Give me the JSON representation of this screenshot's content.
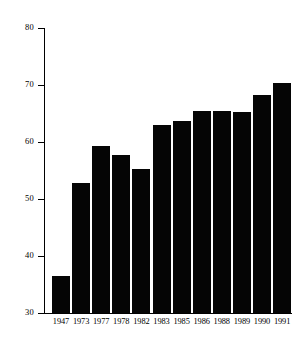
{
  "chart_data": {
    "type": "bar",
    "title": "",
    "subtitle": "",
    "xlabel": "",
    "ylabel": "",
    "categories": [
      "1947",
      "1973",
      "1977",
      "1978",
      "1982",
      "1983",
      "1985",
      "1986",
      "1988",
      "1989",
      "1990",
      "1991"
    ],
    "values": [
      36.5,
      52.8,
      59.3,
      57.7,
      55.3,
      63.0,
      63.6,
      65.5,
      65.5,
      65.3,
      68.2,
      70.3
    ],
    "series": [
      {
        "name": "value",
        "values": [
          36.5,
          52.8,
          59.3,
          57.7,
          55.3,
          63.0,
          63.6,
          65.5,
          65.5,
          65.3,
          68.2,
          70.3
        ]
      }
    ],
    "ylim": [
      30,
      80
    ],
    "yticks": [
      30,
      40,
      50,
      60,
      70,
      80
    ],
    "ytick_labels": [
      "30",
      "40",
      "50",
      "60",
      "70",
      "80"
    ],
    "xlim_categories": 12,
    "grid": false,
    "legend": null,
    "legend_position": "none",
    "bar_color": "#050505",
    "axis_color": "#000000",
    "background_color": "#ffffff",
    "annotations": []
  },
  "axis": {
    "y_labels": [
      "80",
      "70",
      "60",
      "50",
      "40",
      "30"
    ],
    "y_values": [
      80,
      70,
      60,
      50,
      40,
      30
    ]
  },
  "bars": [
    {
      "label": "1947",
      "value": 36.5
    },
    {
      "label": "1973",
      "value": 52.8
    },
    {
      "label": "1977",
      "value": 59.3
    },
    {
      "label": "1978",
      "value": 57.7
    },
    {
      "label": "1982",
      "value": 55.3
    },
    {
      "label": "1983",
      "value": 63.0
    },
    {
      "label": "1985",
      "value": 63.6
    },
    {
      "label": "1986",
      "value": 65.5
    },
    {
      "label": "1988",
      "value": 65.5
    },
    {
      "label": "1989",
      "value": 65.3
    },
    {
      "label": "1990",
      "value": 68.2
    },
    {
      "label": "1991",
      "value": 70.3
    }
  ]
}
